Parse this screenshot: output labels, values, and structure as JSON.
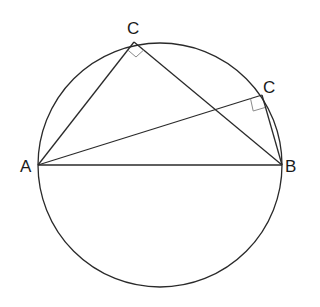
{
  "diagram": {
    "title": "",
    "type": "geometry",
    "colors": {
      "stroke": "#2a2a2a",
      "right_angle_marker": "#8a8a8a",
      "background": "#ffffff"
    },
    "circle": {
      "cx": 160,
      "cy": 165,
      "r": 122
    },
    "points": {
      "A": {
        "label": "A",
        "x": 38,
        "y": 165
      },
      "B": {
        "label": "B",
        "x": 282,
        "y": 165
      },
      "C1": {
        "label": "C",
        "x": 134,
        "y": 42
      },
      "C2": {
        "label": "C",
        "x": 262,
        "y": 95
      }
    },
    "segments": [
      [
        "A",
        "B"
      ],
      [
        "A",
        "C1"
      ],
      [
        "C1",
        "B"
      ],
      [
        "A",
        "C2"
      ],
      [
        "C2",
        "B"
      ]
    ],
    "right_angles": [
      "C1",
      "C2"
    ]
  }
}
